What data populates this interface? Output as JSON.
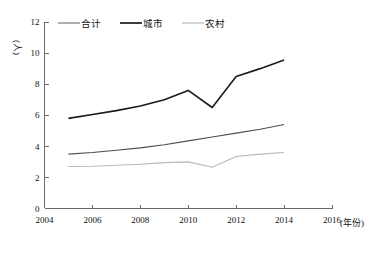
{
  "chart_data": {
    "type": "line",
    "title": "",
    "xlabel": "(年份)",
    "ylabel": "(人)",
    "xlim": [
      2004,
      2016
    ],
    "ylim": [
      0,
      12
    ],
    "xticks": [
      "2004",
      "2006",
      "2008",
      "2010",
      "2012",
      "2014",
      "2016"
    ],
    "xtick_values": [
      2004,
      2006,
      2008,
      2010,
      2012,
      2014,
      2016
    ],
    "yticks": [
      "0",
      "2",
      "4",
      "6",
      "8",
      "10",
      "12"
    ],
    "ytick_values": [
      0,
      2,
      4,
      6,
      8,
      10,
      12
    ],
    "grid": false,
    "legend_position": "top",
    "x": [
      2005,
      2006,
      2007,
      2008,
      2009,
      2010,
      2011,
      2012,
      2013,
      2014
    ],
    "series": [
      {
        "name": "合计",
        "color": "#4d4d4d",
        "width": 1.1,
        "values": [
          3.5,
          3.6,
          3.75,
          3.9,
          4.1,
          4.35,
          4.6,
          4.85,
          5.1,
          5.4
        ]
      },
      {
        "name": "城市",
        "color": "#1a1a1a",
        "width": 1.6,
        "values": [
          5.8,
          6.05,
          6.3,
          6.6,
          7.0,
          7.6,
          6.5,
          8.5,
          9.0,
          9.55
        ]
      },
      {
        "name": "农村",
        "color": "#b8b8b8",
        "width": 1.1,
        "values": [
          2.7,
          2.72,
          2.78,
          2.85,
          2.95,
          3.0,
          2.65,
          3.35,
          3.5,
          3.6
        ]
      }
    ]
  },
  "legend": {
    "items": [
      {
        "label": "合计",
        "color": "#7a7a7a"
      },
      {
        "label": "城市",
        "color": "#1a1a1a"
      },
      {
        "label": "农村",
        "color": "#b8b8b8"
      }
    ]
  },
  "axes": {
    "y_unit_label": "(人)",
    "x_unit_label": "(年份)"
  }
}
